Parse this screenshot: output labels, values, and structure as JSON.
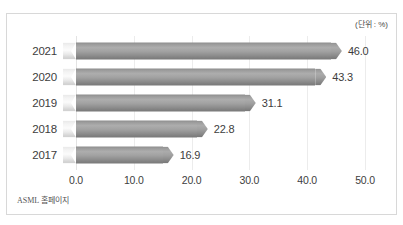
{
  "unit_label": "(단위 : %)",
  "source_note": "ASML 홈페이지",
  "axis": {
    "ticks": [
      "0.0",
      "10.0",
      "20.0",
      "30.0",
      "40.0",
      "50.0"
    ]
  },
  "colors": {
    "bar_body": "#9a9a9a",
    "bar_tail": "#f0f0f0",
    "frame_border": "#d8d8d8",
    "gridline": "#ececec",
    "text": "#3d3d3d",
    "background": "#ffffff"
  },
  "rows": [
    {
      "year": "2021",
      "value_label": "46.0",
      "value": 46.0
    },
    {
      "year": "2020",
      "value_label": "43.3",
      "value": 43.3
    },
    {
      "year": "2019",
      "value_label": "31.1",
      "value": 31.1
    },
    {
      "year": "2018",
      "value_label": "22.8",
      "value": 22.8
    },
    {
      "year": "2017",
      "value_label": "16.9",
      "value": 16.9
    }
  ],
  "chart_data": {
    "type": "bar",
    "orientation": "horizontal",
    "title": "",
    "subtitle": "",
    "xlabel": "",
    "ylabel": "",
    "unit": "%",
    "unit_annotation": "(단위 : %)",
    "source": "ASML 홈페이지",
    "categories": [
      "2021",
      "2020",
      "2019",
      "2018",
      "2017"
    ],
    "values": [
      46.0,
      43.3,
      31.1,
      22.8,
      16.9
    ],
    "data_labels": [
      "46.0",
      "43.3",
      "31.1",
      "22.8",
      "16.9"
    ],
    "xlim": [
      0.0,
      50.0
    ],
    "xticks": [
      0.0,
      10.0,
      20.0,
      30.0,
      40.0,
      50.0
    ],
    "xtick_labels": [
      "0.0",
      "10.0",
      "20.0",
      "30.0",
      "40.0",
      "50.0"
    ],
    "grid": "vertical",
    "legend": null,
    "series": [
      {
        "name": "",
        "values": [
          46.0,
          43.3,
          31.1,
          22.8,
          16.9
        ]
      }
    ]
  }
}
